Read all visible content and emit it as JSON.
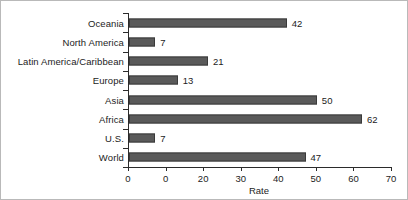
{
  "chart_data": {
    "type": "bar",
    "orientation": "horizontal",
    "title": "",
    "xlabel": "Rate",
    "ylabel": "",
    "categories": [
      "Oceania",
      "North America",
      "Latin America/Caribbean",
      "Europe",
      "Asia",
      "Africa",
      "U.S.",
      "World"
    ],
    "values": [
      42,
      7,
      21,
      13,
      50,
      62,
      7,
      47
    ],
    "value_labels": [
      "42",
      "7",
      "21",
      "13",
      "50",
      "62",
      "7",
      "47"
    ],
    "xlim": [
      0,
      70
    ],
    "xticks": [
      0,
      10,
      20,
      30,
      40,
      50,
      60,
      70
    ],
    "xtick_labels": [
      "0",
      "0",
      "20",
      "30",
      "40",
      "50",
      "60",
      "70"
    ],
    "grid": false,
    "legend": false,
    "bar_color": "#5a5a5a",
    "bar_edge_color": "#3a3a3a",
    "axis_color": "#2b2b2b",
    "text_color": "#1c1c1c",
    "background": "#ffffff"
  }
}
